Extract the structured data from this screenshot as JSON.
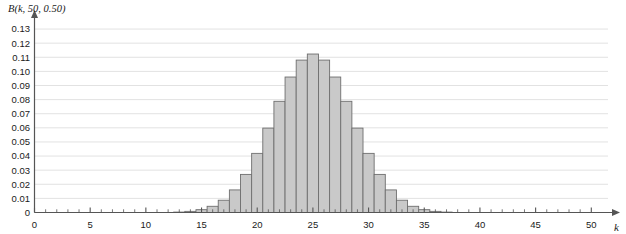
{
  "chart_data": {
    "type": "bar",
    "title": "B(k, 50, 0.50)",
    "xlabel": "k",
    "ylabel": "",
    "xlim": [
      0,
      51.5
    ],
    "ylim": [
      0,
      0.135
    ],
    "grid": true,
    "legend": null,
    "xticks": [
      0,
      5,
      10,
      15,
      20,
      25,
      30,
      35,
      40,
      45,
      50
    ],
    "xticklabels": [
      "0",
      "5",
      "10",
      "15",
      "20",
      "25",
      "30",
      "35",
      "40",
      "45",
      "50"
    ],
    "xminorticks": 1,
    "yticks": [
      0,
      0.01,
      0.02,
      0.03,
      0.04,
      0.05,
      0.06,
      0.07,
      0.08,
      0.09,
      0.1,
      0.11,
      0.12,
      0.13
    ],
    "yticklabels": [
      "0",
      "0.01",
      "0.02",
      "0.03",
      "0.04",
      "0.05",
      "0.06",
      "0.07",
      "0.08",
      "0.09",
      "0.10",
      "0.11",
      "0.12",
      "0.13"
    ],
    "bar_fill": "#c9c9c9",
    "bar_stroke": "#6e6e6e",
    "grid_color": "#e2e2e2",
    "axis_color": "#555555",
    "categories": [
      0,
      1,
      2,
      3,
      4,
      5,
      6,
      7,
      8,
      9,
      10,
      11,
      12,
      13,
      14,
      15,
      16,
      17,
      18,
      19,
      20,
      21,
      22,
      23,
      24,
      25,
      26,
      27,
      28,
      29,
      30,
      31,
      32,
      33,
      34,
      35,
      36,
      37,
      38,
      39,
      40,
      41,
      42,
      43,
      44,
      45,
      46,
      47,
      48,
      49,
      50
    ],
    "values": [
      0.0,
      0.0,
      0.0,
      0.0,
      0.0,
      0.0,
      0.0,
      0.0,
      0.0,
      0.0,
      0.0,
      0.0,
      0.0,
      0.0001,
      0.0002,
      0.0006,
      0.0014,
      0.0032,
      0.0065,
      0.0122,
      0.0207,
      0.0323,
      0.0464,
      0.0614,
      0.0751,
      0.0853,
      0.0896,
      0.0875,
      0.0795,
      0.0673,
      0.053,
      0.0389,
      0.0265,
      0.0168,
      0.0099,
      0.0054,
      0.0027,
      0.0013,
      0.0006,
      0.0002,
      0.0001,
      0.0,
      0.0,
      0.0,
      0.0,
      0.0,
      0.0,
      0.0,
      0.0,
      0.0,
      0.0
    ],
    "values_display": [
      0.0,
      0.0,
      0.0,
      0.0,
      0.0,
      0.0,
      0.0,
      0.0,
      0.0,
      0.0,
      0.0,
      0.0,
      0.0001,
      0.0003,
      0.0008,
      0.002,
      0.0044,
      0.0087,
      0.016,
      0.027,
      0.0419,
      0.0598,
      0.0788,
      0.096,
      0.108,
      0.1123,
      0.108,
      0.096,
      0.0788,
      0.0598,
      0.0419,
      0.027,
      0.016,
      0.0087,
      0.0044,
      0.002,
      0.0008,
      0.0003,
      0.0001,
      0.0,
      0.0,
      0.0,
      0.0,
      0.0,
      0.0,
      0.0,
      0.0,
      0.0,
      0.0,
      0.0,
      0.0
    ],
    "peak_k": 25,
    "peak_value": 0.1123,
    "n": 50,
    "p": 0.5
  }
}
